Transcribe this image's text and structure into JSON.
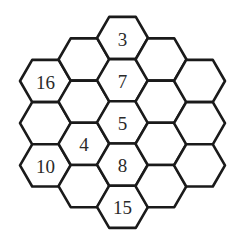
{
  "puzzle": {
    "type": "hexagonal-number-grid",
    "columns": 5,
    "stroke_color": "#1a1a1a",
    "background": "#ffffff",
    "cells": [
      {
        "col": 0,
        "row": 0,
        "value": "16"
      },
      {
        "col": 0,
        "row": 1,
        "value": ""
      },
      {
        "col": 0,
        "row": 2,
        "value": "10"
      },
      {
        "col": 1,
        "row": 0,
        "value": ""
      },
      {
        "col": 1,
        "row": 1,
        "value": ""
      },
      {
        "col": 1,
        "row": 2,
        "value": "4"
      },
      {
        "col": 1,
        "row": 3,
        "value": ""
      },
      {
        "col": 2,
        "row": 0,
        "value": "3"
      },
      {
        "col": 2,
        "row": 1,
        "value": "7"
      },
      {
        "col": 2,
        "row": 2,
        "value": "5"
      },
      {
        "col": 2,
        "row": 3,
        "value": "8"
      },
      {
        "col": 2,
        "row": 4,
        "value": "15"
      },
      {
        "col": 3,
        "row": 0,
        "value": ""
      },
      {
        "col": 3,
        "row": 1,
        "value": ""
      },
      {
        "col": 3,
        "row": 2,
        "value": ""
      },
      {
        "col": 3,
        "row": 3,
        "value": ""
      },
      {
        "col": 4,
        "row": 0,
        "value": ""
      },
      {
        "col": 4,
        "row": 1,
        "value": ""
      },
      {
        "col": 4,
        "row": 2,
        "value": ""
      }
    ]
  }
}
